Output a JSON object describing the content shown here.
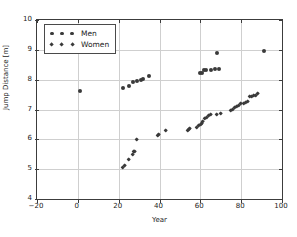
{
  "chart_data": {
    "type": "scatter",
    "title": "",
    "xlabel": "Year",
    "ylabel": "Jump Distance [m]",
    "xlim": [
      -20,
      100
    ],
    "ylim": [
      4,
      10
    ],
    "xticks": [
      -20,
      0,
      20,
      40,
      60,
      80,
      100
    ],
    "xticklabels": [
      "−20",
      "0",
      "20",
      "40",
      "60",
      "80",
      "100"
    ],
    "yticks": [
      4,
      5,
      6,
      7,
      8,
      9,
      10
    ],
    "yticklabels": [
      "4",
      "5",
      "6",
      "7",
      "8",
      "9",
      "10"
    ],
    "grid": true,
    "legend_position": "upper left",
    "marker_color": "#3a3a3a",
    "axis_color": "#3c3c3c",
    "grid_color": "#cfcfcf",
    "series": [
      {
        "name": "Men",
        "marker": "circle",
        "points": [
          [
            1,
            7.61
          ],
          [
            22,
            7.72
          ],
          [
            25,
            7.79
          ],
          [
            27,
            7.92
          ],
          [
            29,
            7.95
          ],
          [
            31,
            7.98
          ],
          [
            32,
            8.01
          ],
          [
            35,
            8.13
          ],
          [
            60,
            8.21
          ],
          [
            61,
            8.24
          ],
          [
            62,
            8.31
          ],
          [
            63,
            8.33
          ],
          [
            65,
            8.34
          ],
          [
            67,
            8.35
          ],
          [
            69,
            8.37
          ],
          [
            68,
            8.9
          ],
          [
            91,
            8.95
          ]
        ]
      },
      {
        "name": "Women",
        "marker": "diamond",
        "points": [
          [
            22,
            5.06
          ],
          [
            23,
            5.1
          ],
          [
            25,
            5.33
          ],
          [
            27,
            5.5
          ],
          [
            27.5,
            5.57
          ],
          [
            28,
            5.6
          ],
          [
            29,
            6.0
          ],
          [
            39,
            6.12
          ],
          [
            39.5,
            6.16
          ],
          [
            43,
            6.28
          ],
          [
            54,
            6.28
          ],
          [
            54.5,
            6.31
          ],
          [
            55,
            6.35
          ],
          [
            58,
            6.4
          ],
          [
            59,
            6.45
          ],
          [
            60,
            6.48
          ],
          [
            60.5,
            6.53
          ],
          [
            61,
            6.6
          ],
          [
            62,
            6.68
          ],
          [
            63,
            6.73
          ],
          [
            64,
            6.78
          ],
          [
            65,
            6.82
          ],
          [
            68,
            6.84
          ],
          [
            70,
            6.86
          ],
          [
            75,
            6.96
          ],
          [
            76,
            7.0
          ],
          [
            77,
            7.07
          ],
          [
            78,
            7.09
          ],
          [
            79,
            7.13
          ],
          [
            80,
            7.2
          ],
          [
            81,
            7.21
          ],
          [
            82,
            7.24
          ],
          [
            83,
            7.27
          ],
          [
            84,
            7.43
          ],
          [
            85,
            7.44
          ],
          [
            86,
            7.45
          ],
          [
            87,
            7.47
          ],
          [
            88,
            7.52
          ]
        ]
      }
    ]
  },
  "legend": {
    "entries": [
      {
        "label": "Men",
        "marker": "circle"
      },
      {
        "label": "Women",
        "marker": "diamond"
      }
    ]
  }
}
